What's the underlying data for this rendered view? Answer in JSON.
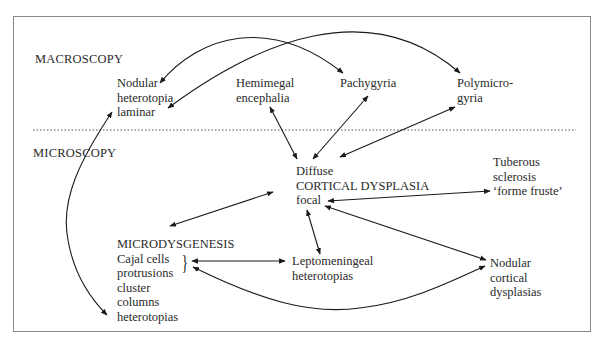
{
  "diagram": {
    "sections": {
      "macroscopy": "MACROSCOPY",
      "microscopy": "MICROSCOPY"
    },
    "nodes": {
      "nodular_heterotopia": [
        "Nodular",
        "heterotopia",
        "laminar"
      ],
      "hemimegalencephalia": [
        "Hemimegal",
        "encephalia"
      ],
      "pachygyria": [
        "Pachygyria"
      ],
      "polymicrogyria": [
        "Polymicro-",
        "gyria"
      ],
      "cortical_dysplasia": [
        "Diffuse",
        "CORTICAL DYSPLASIA",
        "focal"
      ],
      "tuberous_sclerosis": [
        "Tuberous",
        "sclerosis",
        "‘forme fruste’"
      ],
      "microdysgenesis": [
        "MICRODYSGENESIS",
        "Cajal cells",
        "protrusions",
        "cluster",
        "columns",
        "heterotopias"
      ],
      "leptomeningeal": [
        "Leptomeningeal",
        "heterotopias"
      ],
      "nodular_cortical": [
        "Nodular",
        "cortical",
        "dysplasias"
      ]
    },
    "brace": "}",
    "edges": [
      {
        "from": "nodular_heterotopia",
        "to": "pachygyria",
        "type": "curved-arrow"
      },
      {
        "from": "polymicrogyria",
        "to": "nodular_heterotopia",
        "type": "curved-arrow"
      },
      {
        "from": "hemimegalencephalia",
        "to": "cortical_dysplasia",
        "type": "double-arrow"
      },
      {
        "from": "pachygyria",
        "to": "cortical_dysplasia",
        "type": "double-arrow"
      },
      {
        "from": "polymicrogyria",
        "to": "cortical_dysplasia",
        "type": "double-arrow"
      },
      {
        "from": "cortical_dysplasia",
        "to": "microdysgenesis",
        "type": "double-arrow"
      },
      {
        "from": "cortical_dysplasia",
        "to": "tuberous_sclerosis",
        "type": "double-arrow"
      },
      {
        "from": "cortical_dysplasia",
        "to": "leptomeningeal",
        "type": "double-arrow"
      },
      {
        "from": "cortical_dysplasia",
        "to": "nodular_cortical",
        "type": "double-arrow"
      },
      {
        "from": "microdysgenesis",
        "to": "leptomeningeal",
        "type": "double-arrow"
      },
      {
        "from": "microdysgenesis",
        "to": "nodular_cortical",
        "type": "curved-double-arrow"
      },
      {
        "from": "nodular_heterotopia",
        "to": "microdysgenesis",
        "type": "curved-double-arrow"
      }
    ],
    "colors": {
      "line": "#1a1a1a",
      "text": "#2a2a2a",
      "border": "#8a8a8a",
      "divider": "#555555"
    }
  }
}
